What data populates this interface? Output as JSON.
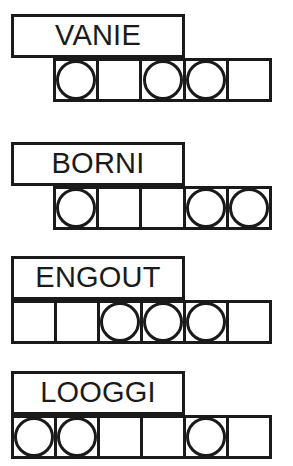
{
  "theme": {
    "ink": "#1a1a1a",
    "paper": "#ffffff"
  },
  "rows": [
    {
      "word": "VANIE",
      "letter_count": 5,
      "word_box": {
        "x": 11,
        "y": 14,
        "width": 174,
        "height": 44
      },
      "grid": {
        "x": 53,
        "y": 58,
        "width": 219,
        "height": 44,
        "cells": 5
      },
      "cells": [
        {
          "index": 1,
          "circle": true
        },
        {
          "index": 2,
          "circle": false
        },
        {
          "index": 3,
          "circle": true
        },
        {
          "index": 4,
          "circle": true
        },
        {
          "index": 5,
          "circle": false
        }
      ]
    },
    {
      "word": "BORNI",
      "letter_count": 5,
      "word_box": {
        "x": 11,
        "y": 142,
        "width": 174,
        "height": 44
      },
      "grid": {
        "x": 53,
        "y": 186,
        "width": 219,
        "height": 44,
        "cells": 5
      },
      "cells": [
        {
          "index": 1,
          "circle": true
        },
        {
          "index": 2,
          "circle": false
        },
        {
          "index": 3,
          "circle": false
        },
        {
          "index": 4,
          "circle": true
        },
        {
          "index": 5,
          "circle": true
        }
      ]
    },
    {
      "word": "ENGOUT",
      "letter_count": 6,
      "word_box": {
        "x": 11,
        "y": 256,
        "width": 174,
        "height": 44
      },
      "grid": {
        "x": 11,
        "y": 300,
        "width": 261,
        "height": 44,
        "cells": 6
      },
      "cells": [
        {
          "index": 1,
          "circle": false
        },
        {
          "index": 2,
          "circle": false
        },
        {
          "index": 3,
          "circle": true
        },
        {
          "index": 4,
          "circle": true
        },
        {
          "index": 5,
          "circle": true
        },
        {
          "index": 6,
          "circle": false
        }
      ]
    },
    {
      "word": "LOOGGI",
      "letter_count": 6,
      "word_box": {
        "x": 11,
        "y": 371,
        "width": 174,
        "height": 44
      },
      "grid": {
        "x": 11,
        "y": 415,
        "width": 261,
        "height": 44,
        "cells": 6
      },
      "cells": [
        {
          "index": 1,
          "circle": true
        },
        {
          "index": 2,
          "circle": true
        },
        {
          "index": 3,
          "circle": false
        },
        {
          "index": 4,
          "circle": false
        },
        {
          "index": 5,
          "circle": true
        },
        {
          "index": 6,
          "circle": false
        }
      ]
    }
  ]
}
